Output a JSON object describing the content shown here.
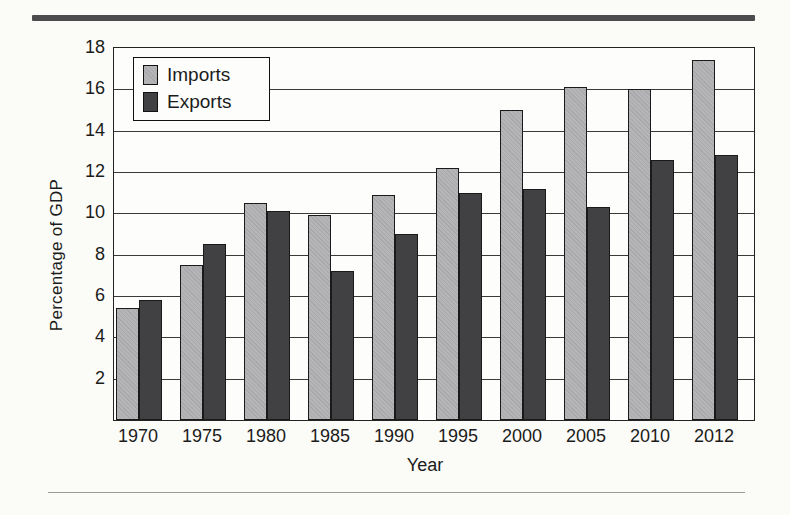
{
  "page": {
    "background_color": "#fbfbf8",
    "top_rule_color": "#4c4c4e",
    "bottom_rule_color": "#9b9b9b"
  },
  "chart_data": {
    "type": "bar",
    "title": "",
    "xlabel": "Year",
    "ylabel": "Percentage of GDP",
    "categories": [
      "1970",
      "1975",
      "1980",
      "1985",
      "1990",
      "1995",
      "2000",
      "2005",
      "2010",
      "2012"
    ],
    "series": [
      {
        "name": "Imports",
        "color": "#b5b5b7",
        "values": [
          5.4,
          7.5,
          10.5,
          9.9,
          10.9,
          12.2,
          15.0,
          16.1,
          16.0,
          17.4
        ]
      },
      {
        "name": "Exports",
        "color": "#414143",
        "values": [
          5.8,
          8.5,
          10.1,
          7.2,
          9.0,
          11.0,
          11.2,
          10.3,
          12.6,
          12.8
        ]
      }
    ],
    "ylim": [
      0,
      18
    ],
    "yticks": [
      2,
      4,
      6,
      8,
      10,
      12,
      14,
      16,
      18
    ],
    "grid": true,
    "grid_color": "#3a3a3a",
    "frame_color": "#222222",
    "legend_position": "top-left"
  }
}
